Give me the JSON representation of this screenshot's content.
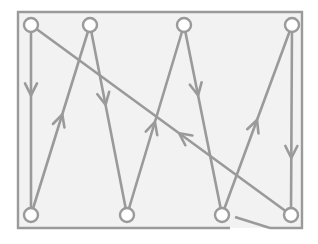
{
  "diagram": {
    "title": "",
    "type": "zigzag-path-with-return",
    "colors": {
      "stroke": "#9a9a9a",
      "background": "#f2f2f2",
      "node_fill": "#ffffff"
    },
    "frame": {
      "x1": 18,
      "y1": 12,
      "x2": 302,
      "y2": 228,
      "bottom_gap_start": 230,
      "bottom_connector": {
        "x1": 235,
        "y1": 217,
        "x2": 270,
        "y2": 228
      }
    },
    "node_radius": 7,
    "nodes": [
      {
        "id": "top-1",
        "x": 31,
        "y": 25
      },
      {
        "id": "top-2",
        "x": 90,
        "y": 25
      },
      {
        "id": "top-3",
        "x": 184,
        "y": 25
      },
      {
        "id": "top-4",
        "x": 292,
        "y": 25
      },
      {
        "id": "bottom-1",
        "x": 31,
        "y": 215
      },
      {
        "id": "bottom-2",
        "x": 127,
        "y": 215
      },
      {
        "id": "bottom-3",
        "x": 222,
        "y": 215
      },
      {
        "id": "bottom-4",
        "x": 291,
        "y": 215
      }
    ],
    "edges": [
      {
        "from": "top-1",
        "to": "bottom-1",
        "arrow_t": 0.37,
        "direction": "down"
      },
      {
        "from": "bottom-1",
        "to": "top-2",
        "arrow_t": 0.53,
        "direction": "up"
      },
      {
        "from": "top-2",
        "to": "bottom-2",
        "arrow_t": 0.42,
        "direction": "down"
      },
      {
        "from": "bottom-2",
        "to": "top-3",
        "arrow_t": 0.49,
        "direction": "up"
      },
      {
        "from": "top-3",
        "to": "bottom-3",
        "arrow_t": 0.37,
        "direction": "down"
      },
      {
        "from": "bottom-3",
        "to": "top-4",
        "arrow_t": 0.5,
        "direction": "up"
      },
      {
        "from": "top-4",
        "to": "bottom-4",
        "arrow_t": 0.7,
        "direction": "down"
      },
      {
        "from": "bottom-4",
        "to": "top-1",
        "arrow_t": 0.43,
        "direction": "up-left"
      }
    ]
  }
}
